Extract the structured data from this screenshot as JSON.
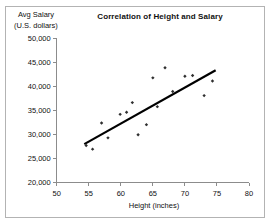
{
  "window": {
    "background": "#ffffff",
    "frame_border_color": "#b3b3b3",
    "axis_color": "#8c8c8c"
  },
  "labels": {
    "y_axis_title_line1": "Avg Salary",
    "y_axis_title_line2": "(U.S. dollars)"
  },
  "chart_data": {
    "type": "scatter",
    "title": "Correlation of Height and Salary",
    "xlabel": "Height (inches)",
    "ylabel": "Avg Salary (U.S. dollars)",
    "xlim": [
      50,
      80
    ],
    "ylim": [
      20000,
      50000
    ],
    "x_ticks": [
      50,
      55,
      60,
      65,
      70,
      75,
      80
    ],
    "y_ticks": [
      20000,
      25000,
      30000,
      35000,
      40000,
      45000,
      50000
    ],
    "y_tick_labels": [
      "20,000",
      "25,000",
      "30,000",
      "35,000",
      "40,000",
      "45,000",
      "50,000"
    ],
    "grid": false,
    "legend": false,
    "marker_color": "#2f2f2f",
    "trendline_color": "#000000",
    "points": [
      {
        "height": 54.6,
        "salary": 27700
      },
      {
        "height": 55.6,
        "salary": 26950
      },
      {
        "height": 57.0,
        "salary": 32400
      },
      {
        "height": 58.0,
        "salary": 29300
      },
      {
        "height": 59.9,
        "salary": 34200
      },
      {
        "height": 60.9,
        "salary": 34650
      },
      {
        "height": 61.8,
        "salary": 36650
      },
      {
        "height": 62.7,
        "salary": 29950
      },
      {
        "height": 64.0,
        "salary": 32050
      },
      {
        "height": 65.0,
        "salary": 41800
      },
      {
        "height": 65.7,
        "salary": 35800
      },
      {
        "height": 66.9,
        "salary": 43900
      },
      {
        "height": 68.1,
        "salary": 38950
      },
      {
        "height": 70.0,
        "salary": 42150
      },
      {
        "height": 71.2,
        "salary": 42300
      },
      {
        "height": 73.0,
        "salary": 38100
      },
      {
        "height": 74.3,
        "salary": 41150
      }
    ],
    "trendline": {
      "x1": 54.3,
      "y1": 28000,
      "x2": 74.8,
      "y2": 43400
    }
  }
}
